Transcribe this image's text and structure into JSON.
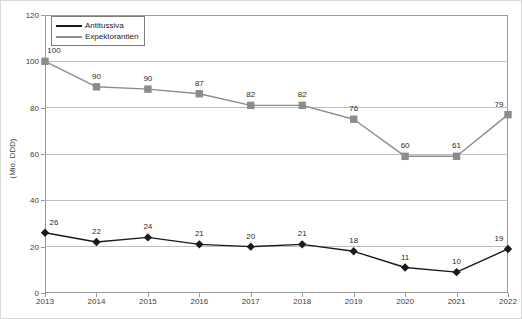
{
  "chart_data": {
    "type": "line",
    "title": "",
    "xlabel": "",
    "ylabel": "(Mio. DDD)",
    "ylim": [
      0,
      120
    ],
    "yticks": [
      0,
      20,
      40,
      60,
      80,
      100,
      120
    ],
    "grid": true,
    "legend_position": "top-left",
    "categories": [
      "2013",
      "2014",
      "2015",
      "2016",
      "2017",
      "2018",
      "2019",
      "2020",
      "2021",
      "2022"
    ],
    "series": [
      {
        "name": "Antitussiva",
        "color": "#1a1a1a",
        "marker": "diamond",
        "values": [
          26,
          22,
          24,
          21,
          20,
          21,
          18,
          11,
          10,
          19
        ],
        "plotted": [
          26,
          22,
          24,
          21,
          20,
          21,
          18,
          11,
          9,
          19
        ]
      },
      {
        "name": "Expektorantien",
        "color": "#8c8c8c",
        "marker": "square",
        "values": [
          100,
          90,
          90,
          87,
          82,
          82,
          76,
          60,
          61,
          79
        ],
        "plotted": [
          100,
          89,
          88,
          86,
          81,
          81,
          75,
          59,
          59,
          77
        ]
      }
    ]
  },
  "axes": {
    "y_title": "(Mio. DDD)",
    "y_tick_labels": [
      "0",
      "20",
      "40",
      "60",
      "80",
      "100",
      "120"
    ],
    "x_tick_labels": [
      "2013",
      "2014",
      "2015",
      "2016",
      "2017",
      "2018",
      "2019",
      "2020",
      "2021",
      "2022"
    ]
  },
  "legend": {
    "items": [
      {
        "label": "Antitussiva"
      },
      {
        "label": "Expektorantien"
      }
    ]
  },
  "colors": {
    "antitussiva": "#1a1a1a",
    "expektorantien": "#8c8c8c",
    "gridline": "#bfbfbf",
    "axis": "#9a9a9a",
    "frame": "#d9d9d9"
  }
}
